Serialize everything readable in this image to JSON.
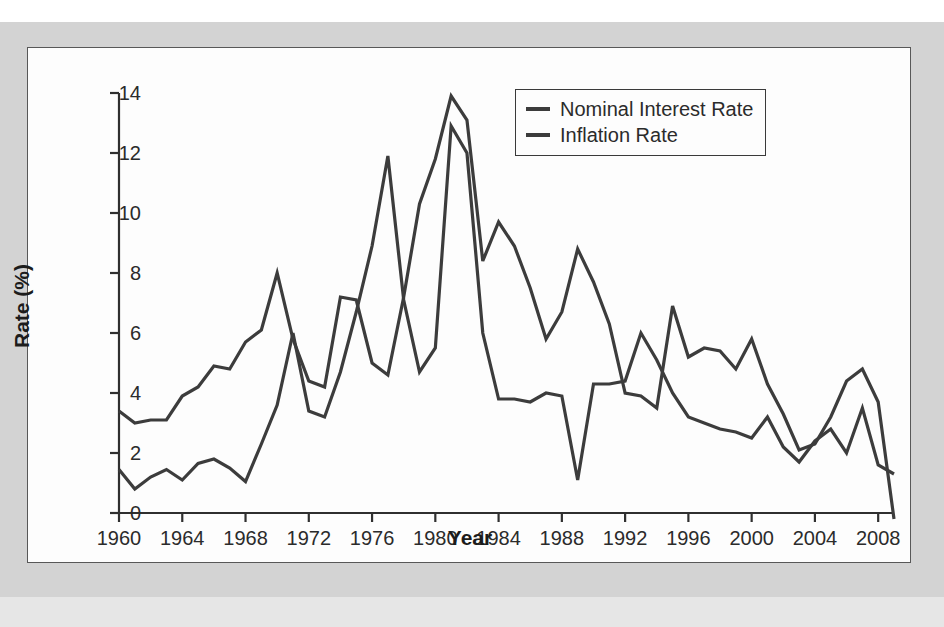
{
  "figure": {
    "y_axis_title": "Rate (%)",
    "x_axis_title": "Year"
  },
  "legend": {
    "position": "top-right-inside",
    "entries": [
      {
        "label": "Nominal Interest Rate",
        "color": "#3c3c3c"
      },
      {
        "label": "Inflation Rate",
        "color": "#3c3c3c"
      }
    ]
  },
  "axes": {
    "y_ticks": [
      "0",
      "2",
      "4",
      "6",
      "8",
      "10",
      "12",
      "14"
    ],
    "x_ticks": [
      "1960",
      "1964",
      "1968",
      "1972",
      "1976",
      "1980",
      "1984",
      "1988",
      "1992",
      "1996",
      "2000",
      "2004",
      "2008"
    ]
  },
  "chart_data": {
    "type": "line",
    "title": "",
    "xlabel": "Year",
    "ylabel": "Rate (%)",
    "xlim": [
      1960,
      2009
    ],
    "ylim": [
      -0.4,
      14
    ],
    "grid": false,
    "legend_position": "upper right",
    "x": [
      1960,
      1961,
      1962,
      1963,
      1964,
      1965,
      1966,
      1967,
      1968,
      1969,
      1970,
      1971,
      1972,
      1973,
      1974,
      1975,
      1976,
      1977,
      1978,
      1979,
      1980,
      1981,
      1982,
      1983,
      1984,
      1985,
      1986,
      1987,
      1988,
      1989,
      1990,
      1991,
      1992,
      1993,
      1994,
      1995,
      1996,
      1997,
      1998,
      1999,
      2000,
      2001,
      2002,
      2003,
      2004,
      2005,
      2006,
      2007,
      2008,
      2009
    ],
    "series": [
      {
        "name": "Nominal Interest Rate",
        "color": "#3c3c3c",
        "values": [
          3.4,
          3.0,
          3.1,
          3.1,
          3.9,
          4.2,
          4.9,
          4.8,
          5.7,
          6.1,
          8.0,
          5.8,
          4.4,
          4.2,
          7.2,
          7.1,
          5.0,
          4.6,
          7.2,
          10.3,
          11.8,
          13.9,
          13.1,
          8.4,
          9.7,
          8.9,
          7.5,
          5.8,
          6.7,
          8.8,
          7.7,
          6.3,
          4.0,
          3.9,
          3.5,
          6.9,
          5.2,
          5.5,
          5.4,
          4.8,
          5.8,
          4.3,
          3.3,
          2.1,
          2.3,
          3.2,
          4.4,
          4.8,
          3.7,
          -0.2
        ]
      },
      {
        "name": "Inflation Rate",
        "color": "#3c3c3c",
        "values": [
          1.45,
          0.8,
          1.2,
          1.45,
          1.1,
          1.65,
          1.8,
          1.5,
          1.05,
          2.3,
          3.6,
          6.0,
          3.4,
          3.2,
          4.7,
          6.7,
          8.9,
          11.9,
          7.1,
          4.7,
          5.5,
          12.9,
          12.0,
          6.0,
          3.8,
          3.8,
          3.7,
          4.0,
          3.9,
          1.1,
          4.3,
          4.3,
          4.4,
          6.0,
          5.1,
          4.0,
          3.2,
          3.0,
          2.8,
          2.7,
          2.5,
          3.2,
          2.2,
          1.7,
          2.4,
          2.8,
          2.0,
          3.5,
          1.6,
          1.3
        ]
      }
    ]
  }
}
